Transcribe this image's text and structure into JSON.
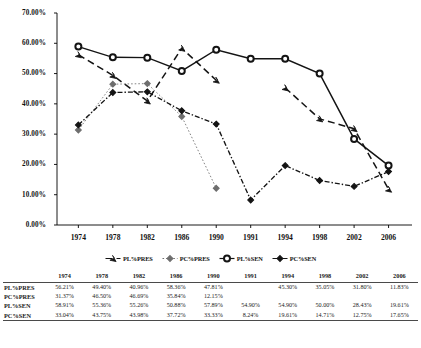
{
  "chart_data": {
    "type": "line",
    "title": "",
    "xlabel": "",
    "ylabel": "",
    "ylim": [
      0,
      70
    ],
    "ytick_step": 10,
    "grid": false,
    "legend_position": "bottom",
    "categories": [
      "1974",
      "1978",
      "1982",
      "1986",
      "1990",
      "1991",
      "1994",
      "1998",
      "2002",
      "2006"
    ],
    "ytick_labels": [
      "70.00%",
      "60.00%",
      "50.00%",
      "40.00%",
      "30.00%",
      "20.00%",
      "10.00%",
      "0.00%"
    ],
    "ytick_values": [
      70,
      60,
      50,
      40,
      30,
      20,
      10,
      0
    ],
    "series": [
      {
        "name": "PL%PRES",
        "style": "dashed",
        "marker": "arrow",
        "values": [
          56.21,
          49.4,
          40.96,
          58.36,
          47.81,
          null,
          45.3,
          35.05,
          31.8,
          11.83
        ]
      },
      {
        "name": "PC%PRES",
        "style": "dotted",
        "marker": "diamond",
        "values": [
          31.37,
          46.5,
          46.69,
          35.84,
          12.15,
          null,
          null,
          null,
          null,
          null
        ]
      },
      {
        "name": "PL%SEN",
        "style": "solid",
        "marker": "circle",
        "values": [
          58.91,
          55.36,
          55.26,
          50.88,
          57.89,
          54.9,
          54.9,
          50.0,
          28.43,
          19.61
        ]
      },
      {
        "name": "PC%SEN",
        "style": "dash-dot",
        "marker": "diamond",
        "values": [
          33.04,
          43.75,
          43.98,
          37.72,
          33.33,
          8.24,
          19.61,
          14.71,
          12.75,
          17.65
        ]
      }
    ]
  },
  "legend": {
    "items": [
      {
        "label": "PL%PRES",
        "marker": "arrow-marker"
      },
      {
        "label": "PC%PRES",
        "marker": "diamond-marker"
      },
      {
        "label": "PL%SEN",
        "marker": "circle-marker"
      },
      {
        "label": "PC%SEN",
        "marker": "diamond-marker"
      }
    ]
  },
  "table": {
    "corner_label": "",
    "columns": [
      "1974",
      "1978",
      "1982",
      "1986",
      "1990",
      "1991",
      "1994",
      "1998",
      "2002",
      "2006"
    ],
    "rows": [
      {
        "label": "PL%PRES",
        "cells": [
          "56.21%",
          "49.40%",
          "40.96%",
          "58.36%",
          "47.81%",
          "",
          "45.30%",
          "35.05%",
          "31.80%",
          "11.83%"
        ]
      },
      {
        "label": "PC%PRES",
        "cells": [
          "31.37%",
          "46.50%",
          "46.69%",
          "35.84%",
          "12.15%",
          "",
          "",
          "",
          "",
          ""
        ]
      },
      {
        "label": "PL%SEN",
        "cells": [
          "58.91%",
          "55.36%",
          "55.26%",
          "50.88%",
          "57.89%",
          "54.90%",
          "54.90%",
          "50.00%",
          "28.43%",
          "19.61%"
        ]
      },
      {
        "label": "PC%SEN",
        "cells": [
          "33.04%",
          "43.75%",
          "43.98%",
          "37.72%",
          "33.33%",
          "8.24%",
          "19.61%",
          "14.71%",
          "12.75%",
          "17.65%"
        ]
      }
    ]
  },
  "colors": {
    "axis": "#000000",
    "series_dark": "#141414",
    "series_gray": "#6e6e6e",
    "background": "#ffffff"
  }
}
